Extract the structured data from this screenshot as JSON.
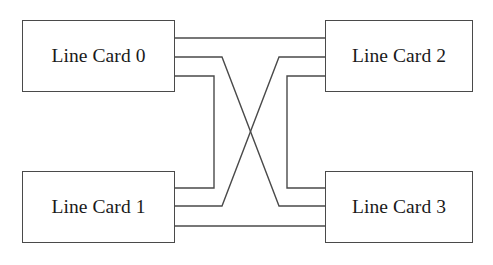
{
  "diagram": {
    "background_color": "#ffffff",
    "line_color": "#4a4a4a",
    "text_color": "#1a1a1a",
    "width": 493,
    "height": 265,
    "nodes": [
      {
        "id": "lc0",
        "label": "Line Card 0",
        "x": 22,
        "y": 20,
        "w": 153,
        "h": 72
      },
      {
        "id": "lc2",
        "label": "Line Card 2",
        "x": 325,
        "y": 20,
        "w": 148,
        "h": 72
      },
      {
        "id": "lc1",
        "label": "Line Card 1",
        "x": 22,
        "y": 171,
        "w": 153,
        "h": 72
      },
      {
        "id": "lc3",
        "label": "Line Card 3",
        "x": 325,
        "y": 171,
        "w": 148,
        "h": 72
      }
    ],
    "links": [
      {
        "id": "link-lc0-lc2",
        "from": "lc0",
        "to": "lc2",
        "style": "straight-horizontal",
        "points": "175,38 325,38"
      },
      {
        "id": "link-lc1-lc3",
        "from": "lc1",
        "to": "lc3",
        "style": "straight-horizontal",
        "points": "175,226 325,226"
      },
      {
        "id": "link-lc0-lc1",
        "from": "lc0",
        "to": "lc1",
        "style": "orthogonal-left-bus",
        "points": "175,76 214,76 214,188 175,188"
      },
      {
        "id": "link-lc2-lc3",
        "from": "lc2",
        "to": "lc3",
        "style": "orthogonal-right-bus",
        "points": "325,76 287,76 287,188 325,188"
      },
      {
        "id": "link-lc0-lc3",
        "from": "lc0",
        "to": "lc3",
        "style": "diagonal-crossing",
        "points": "175,57 222,57 279,206 325,206"
      },
      {
        "id": "link-lc1-lc2",
        "from": "lc1",
        "to": "lc2",
        "style": "diagonal-crossing",
        "points": "175,206 222,206 279,57 325,57"
      }
    ],
    "crossing_point": {
      "x": 250,
      "y": 132
    }
  }
}
